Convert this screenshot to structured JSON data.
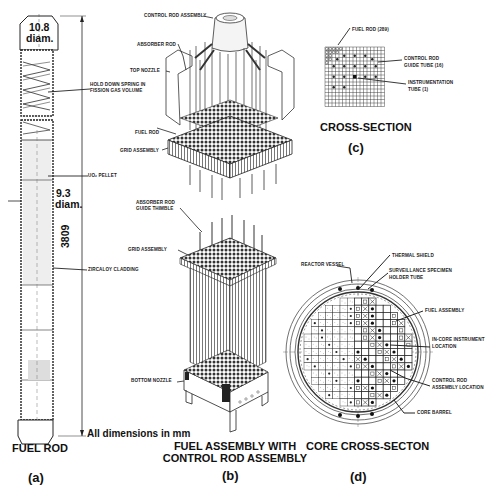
{
  "panel_a": {
    "dim_top": "10.8",
    "dim_top_unit": "diam.",
    "dim_mid": "9.3",
    "dim_mid_unit": "diam.",
    "length": "3809",
    "units_note": "All dimensions in mm",
    "labels": {
      "spring": "HOLD DOWN SPRING IN",
      "spring2": "FISSION GAS VOLUME",
      "pellet": "UO₂ PELLET",
      "cladding": "ZIRCALOY CLADDING"
    },
    "caption": "FUEL ROD",
    "letter": "(a)"
  },
  "panel_b": {
    "labels": {
      "control_rod_assembly": "CONTROL ROD ASSEMBLY",
      "absorber_rod": "ABSORBER ROD",
      "top_nozzle": "TOP NOZZLE",
      "fuel_rod": "FUEL ROD",
      "grid_assembly_1": "GRID ASSEMBLY",
      "guide_thimble_1": "ABSORBER ROD",
      "guide_thimble_2": "GUIDE THIMBLE",
      "grid_assembly_2": "GRID ASSEMBLY",
      "bottom_nozzle": "BOTTOM NOZZLE"
    },
    "caption_line1": "FUEL ASSEMBLY WITH",
    "caption_line2": "CONTROL ROD ASSEMBLY",
    "letter": "(b)"
  },
  "panel_c": {
    "labels": {
      "fuel_rod": "FUEL ROD (289)",
      "guide_tube_1": "CONTROL ROD",
      "guide_tube_2": "GUIDE TUBE (16)",
      "instrument_1": "INSTRUMENTATION",
      "instrument_2": "TUBE (1)"
    },
    "grid_size": 17,
    "caption": "CROSS-SECTION",
    "letter": "(c)"
  },
  "panel_d": {
    "labels": {
      "reactor_vessel": "REACTOR VESSEL",
      "thermal_shield": "THERMAL SHIELD",
      "surveillance_1": "SURVEILLANCE SPECIMEN",
      "surveillance_2": "HOLDER TUBE",
      "fuel_assembly": "FUEL ASSEMBLY",
      "incore_1": "IN-CORE INSTRUMENT",
      "incore_2": "LOCATION",
      "crl_1": "CONTROL ROD",
      "crl_2": "ASSEMBLY LOCATION",
      "core_barrel": "CORE BARREL"
    },
    "caption": "CORE CROSS-SECTON",
    "letter": "(d)"
  }
}
